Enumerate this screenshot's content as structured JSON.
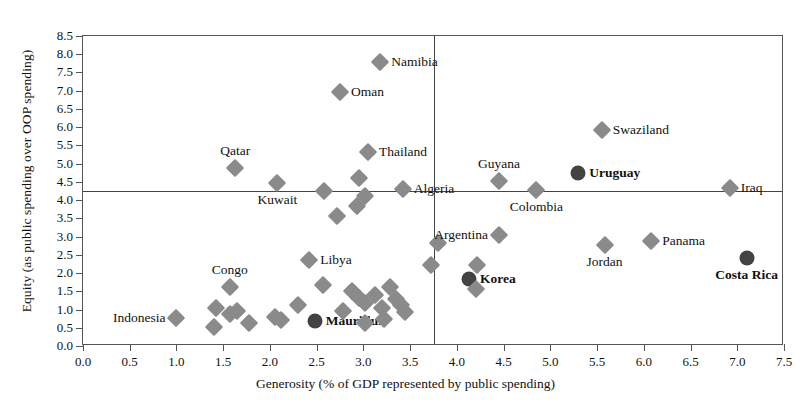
{
  "chart_data": {
    "type": "scatter",
    "title": "",
    "xlabel": "Generosity (% of GDP represented by public spending)",
    "ylabel": "Equity  (as public spending over OOP spending)",
    "xlim": [
      0.0,
      7.5
    ],
    "ylim": [
      0.0,
      8.5
    ],
    "xticks": [
      "0.0",
      "0.5",
      "1.0",
      "1.5",
      "2.0",
      "2.5",
      "3.0",
      "3.5",
      "4.0",
      "4.5",
      "5.0",
      "5.5",
      "6.0",
      "6.5",
      "7.0",
      "7.5"
    ],
    "yticks": [
      "0.0",
      "0.5",
      "1.0",
      "1.5",
      "2.0",
      "2.5",
      "3.0",
      "3.5",
      "4.0",
      "4.5",
      "5.0",
      "5.5",
      "6.0",
      "6.5",
      "7.0",
      "7.5",
      "8.0",
      "8.5"
    ],
    "grid": false,
    "legend": "none",
    "reference_lines": {
      "horizontal_y": 4.25,
      "vertical_x": 3.75
    },
    "marker_colors": {
      "normal": "#8a8a8a",
      "highlighted": "#434343"
    },
    "points": [
      {
        "name": "Namibia",
        "x": 3.18,
        "y": 7.8,
        "label": "Namibia",
        "highlight": false,
        "label_side": "right"
      },
      {
        "name": "Oman",
        "x": 2.75,
        "y": 6.97,
        "label": "Oman",
        "highlight": false,
        "label_side": "right"
      },
      {
        "name": "Swaziland",
        "x": 5.55,
        "y": 5.92,
        "label": "Swaziland",
        "highlight": false,
        "label_side": "right"
      },
      {
        "name": "Thailand",
        "x": 3.05,
        "y": 5.33,
        "label": "Thailand",
        "highlight": false,
        "label_side": "right"
      },
      {
        "name": "Qatar",
        "x": 1.63,
        "y": 4.87,
        "label": "Qatar",
        "highlight": false,
        "label_side": "above"
      },
      {
        "name": "Uruguay",
        "x": 5.3,
        "y": 4.75,
        "label": "Uruguay",
        "highlight": true,
        "label_side": "right"
      },
      {
        "name": "Guyana",
        "x": 4.45,
        "y": 4.52,
        "label": "Guyana",
        "highlight": false,
        "label_side": "above"
      },
      {
        "name": "Kuwait",
        "x": 2.08,
        "y": 4.47,
        "label": "Kuwait",
        "highlight": false,
        "label_side": "below"
      },
      {
        "name": "u1",
        "x": 2.95,
        "y": 4.6,
        "label": "",
        "highlight": false
      },
      {
        "name": "u2",
        "x": 2.58,
        "y": 4.26,
        "label": "",
        "highlight": false
      },
      {
        "name": "u3",
        "x": 3.02,
        "y": 4.12,
        "label": "",
        "highlight": false
      },
      {
        "name": "u4",
        "x": 2.93,
        "y": 3.84,
        "label": "",
        "highlight": false
      },
      {
        "name": "Algeria",
        "x": 3.42,
        "y": 4.3,
        "label": "Algeria",
        "highlight": false,
        "label_side": "right"
      },
      {
        "name": "Colombia",
        "x": 4.85,
        "y": 4.28,
        "label": "Colombia",
        "highlight": false,
        "label_side": "below"
      },
      {
        "name": "Iraq",
        "x": 6.92,
        "y": 4.32,
        "label": "Iraq",
        "highlight": false,
        "label_side": "right"
      },
      {
        "name": "u5",
        "x": 2.72,
        "y": 3.57,
        "label": "",
        "highlight": false
      },
      {
        "name": "u6",
        "x": 3.8,
        "y": 2.82,
        "label": "",
        "highlight": false
      },
      {
        "name": "u7",
        "x": 3.72,
        "y": 2.22,
        "label": "",
        "highlight": false
      },
      {
        "name": "Argentina",
        "x": 4.45,
        "y": 3.03,
        "label": "Argentina",
        "highlight": false,
        "label_side": "left"
      },
      {
        "name": "Panama",
        "x": 6.08,
        "y": 2.88,
        "label": "Panama",
        "highlight": false,
        "label_side": "right"
      },
      {
        "name": "Jordan",
        "x": 5.58,
        "y": 2.78,
        "label": "Jordan",
        "highlight": false,
        "label_side": "below"
      },
      {
        "name": "Costa Rica",
        "x": 7.1,
        "y": 2.42,
        "label": "Costa Rica",
        "highlight": true,
        "label_side": "below"
      },
      {
        "name": "Libya",
        "x": 2.42,
        "y": 2.36,
        "label": "Libya",
        "highlight": false,
        "label_side": "right"
      },
      {
        "name": "Korea",
        "x": 4.13,
        "y": 1.85,
        "label": "Korea",
        "highlight": true,
        "label_side": "right"
      },
      {
        "name": "u8",
        "x": 4.22,
        "y": 2.22,
        "label": "",
        "highlight": false
      },
      {
        "name": "u9",
        "x": 4.2,
        "y": 1.55,
        "label": "",
        "highlight": false
      },
      {
        "name": "Congo",
        "x": 1.57,
        "y": 1.63,
        "label": "Congo",
        "highlight": false,
        "label_side": "above"
      },
      {
        "name": "Indonesia",
        "x": 1.0,
        "y": 0.78,
        "label": "Indonesia",
        "highlight": false,
        "label_side": "left"
      },
      {
        "name": "Mauritius",
        "x": 2.48,
        "y": 0.68,
        "label": "Mauritius",
        "highlight": true,
        "label_side": "right"
      },
      {
        "name": "u10",
        "x": 2.57,
        "y": 1.68,
        "label": "",
        "highlight": false
      },
      {
        "name": "u11",
        "x": 2.88,
        "y": 1.52,
        "label": "",
        "highlight": false
      },
      {
        "name": "u12",
        "x": 2.95,
        "y": 1.32,
        "label": "",
        "highlight": false
      },
      {
        "name": "u13",
        "x": 3.02,
        "y": 1.18,
        "label": "",
        "highlight": false
      },
      {
        "name": "u14",
        "x": 3.12,
        "y": 1.4,
        "label": "",
        "highlight": false
      },
      {
        "name": "u15",
        "x": 3.2,
        "y": 1.05,
        "label": "",
        "highlight": false
      },
      {
        "name": "u16",
        "x": 3.28,
        "y": 1.62,
        "label": "",
        "highlight": false
      },
      {
        "name": "u17",
        "x": 3.35,
        "y": 1.3,
        "label": "",
        "highlight": false
      },
      {
        "name": "u18",
        "x": 3.4,
        "y": 1.12,
        "label": "",
        "highlight": false
      },
      {
        "name": "u19",
        "x": 3.45,
        "y": 0.92,
        "label": "",
        "highlight": false
      },
      {
        "name": "u20",
        "x": 3.22,
        "y": 0.73,
        "label": "",
        "highlight": false
      },
      {
        "name": "u21",
        "x": 3.02,
        "y": 0.62,
        "label": "",
        "highlight": false
      },
      {
        "name": "u22",
        "x": 2.78,
        "y": 0.97,
        "label": "",
        "highlight": false
      },
      {
        "name": "u23",
        "x": 2.3,
        "y": 1.13,
        "label": "",
        "highlight": false
      },
      {
        "name": "u24",
        "x": 2.12,
        "y": 0.72,
        "label": "",
        "highlight": false
      },
      {
        "name": "u25",
        "x": 2.05,
        "y": 0.8,
        "label": "",
        "highlight": false
      },
      {
        "name": "u26",
        "x": 1.65,
        "y": 0.95,
        "label": "",
        "highlight": false
      },
      {
        "name": "u27",
        "x": 1.57,
        "y": 0.88,
        "label": "",
        "highlight": false
      },
      {
        "name": "u28",
        "x": 1.4,
        "y": 0.52,
        "label": "",
        "highlight": false
      },
      {
        "name": "u29",
        "x": 1.78,
        "y": 0.62,
        "label": "",
        "highlight": false
      },
      {
        "name": "u30",
        "x": 1.42,
        "y": 1.05,
        "label": "",
        "highlight": false
      }
    ]
  }
}
